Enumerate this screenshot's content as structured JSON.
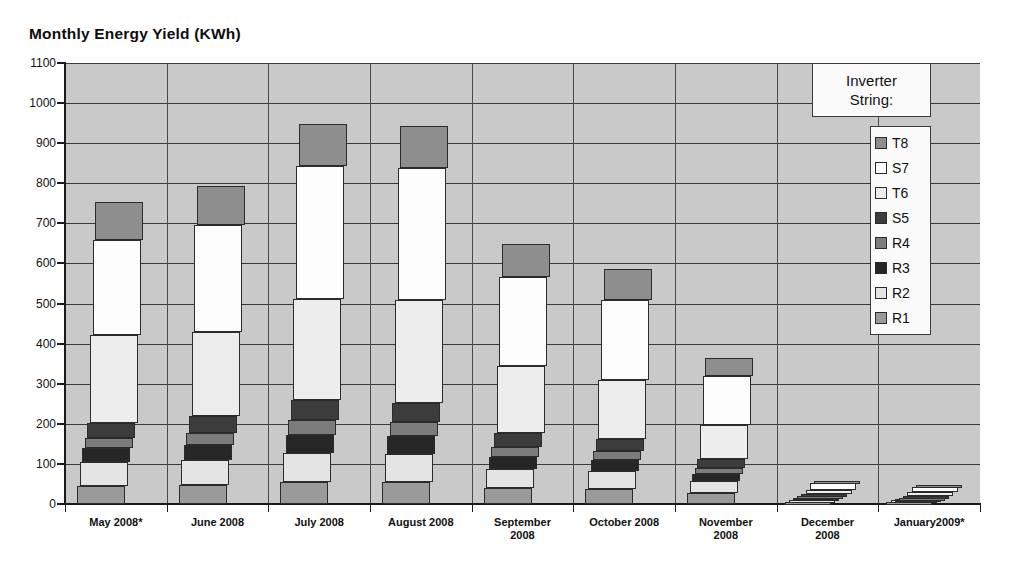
{
  "chart_data": {
    "type": "bar",
    "subtype": "stacked-column",
    "title": "Monthly Energy Yield (KWh)",
    "xlabel": "",
    "ylabel": "",
    "ylim": [
      0,
      1100
    ],
    "ytick_step": 100,
    "yticks": [
      0,
      100,
      200,
      300,
      400,
      500,
      600,
      700,
      800,
      900,
      1000,
      1100
    ],
    "grid": true,
    "grid_axis": "both",
    "legend_position": "top-right",
    "legend_title": "Inverter String:",
    "plot_background": "#c9c9c9",
    "categories": [
      "May 2008*",
      "June 2008",
      "July 2008",
      "August 2008",
      "September\n2008",
      "October 2008",
      "November\n2008",
      "December\n2008",
      "January2009*"
    ],
    "series_stack_order_bottom_to_top": [
      "R1",
      "R2",
      "R3",
      "R4",
      "S5",
      "T6",
      "S7",
      "T8"
    ],
    "legend_entries_top_to_bottom": [
      "T8",
      "S7",
      "T6",
      "S5",
      "R4",
      "R3",
      "R2",
      "R1"
    ],
    "series": [
      {
        "name": "T8",
        "color": "#8e8e8e",
        "values": [
          95,
          98,
          107,
          105,
          83,
          75,
          45,
          5,
          5
        ]
      },
      {
        "name": "S7",
        "color": "#fdfdfd",
        "values": [
          238,
          268,
          330,
          330,
          222,
          200,
          123,
          17,
          14
        ]
      },
      {
        "name": "T6",
        "color": "#ededed",
        "values": [
          218,
          208,
          252,
          255,
          168,
          148,
          85,
          10,
          9
        ]
      },
      {
        "name": "S5",
        "color": "#3c3c3c",
        "values": [
          38,
          42,
          50,
          48,
          33,
          30,
          20,
          6,
          4
        ]
      },
      {
        "name": "R4",
        "color": "#7c7c7c",
        "values": [
          25,
          30,
          38,
          35,
          25,
          22,
          15,
          4,
          3
        ]
      },
      {
        "name": "R3",
        "color": "#262626",
        "values": [
          35,
          38,
          45,
          45,
          30,
          27,
          18,
          5,
          4
        ]
      },
      {
        "name": "R2",
        "color": "#e4e4e4",
        "values": [
          60,
          62,
          72,
          70,
          48,
          45,
          30,
          6,
          5
        ]
      },
      {
        "name": "R1",
        "color": "#9a9a9a",
        "values": [
          45,
          48,
          55,
          55,
          40,
          38,
          28,
          5,
          4
        ]
      }
    ],
    "totals": [
      754,
      794,
      949,
      943,
      649,
      585,
      364,
      58,
      48
    ],
    "bar_tops_approx": [
      815,
      875,
      1025,
      1020,
      725,
      655,
      385,
      57,
      47
    ]
  },
  "colors": {
    "plot_bg": "#c9c9c9",
    "grid": "#3a3a3a",
    "axis": "#1a1a1a",
    "text": "#111111",
    "legend_bg": "#fbfbfb"
  }
}
